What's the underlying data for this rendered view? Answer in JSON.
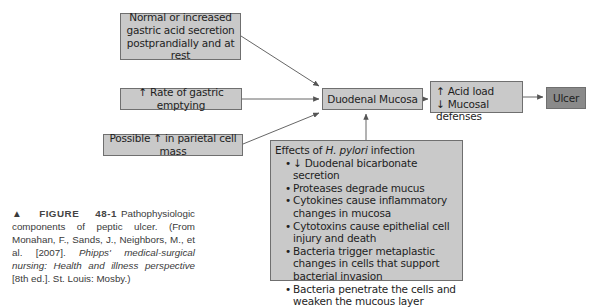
{
  "figure": {
    "nodes": {
      "normal_acid": {
        "lines": [
          "Normal or increased",
          "gastric acid secretion",
          "postprandially and at rest"
        ]
      },
      "gastric_emptying": {
        "text": "↑ Rate of gastric emptying"
      },
      "parietal_mass": {
        "text": "Possible ↑ in parietal cell mass"
      },
      "duodenal_mucosa": {
        "text": "Duodenal Mucosa"
      },
      "acid_load": {
        "lines": [
          "↑ Acid load",
          "↓ Mucosal defenses"
        ]
      },
      "ulcer": {
        "text": "Ulcer"
      },
      "h_pylori": {
        "title_prefix": "Effects of ",
        "title_italic": "H. pylori",
        "title_suffix": " infection",
        "items": [
          "↓ Duodenal bicarbonate secretion",
          "Proteases degrade mucus",
          "Cytokines cause inflammatory changes in mucosa",
          "Cytotoxins cause epithelial cell injury and death",
          "Bacteria trigger metaplastic changes in cells that support bacterial invasion",
          "Bacteria penetrate the cells and weaken the mucous layer"
        ]
      }
    },
    "colors": {
      "box_fill": "#c9c9c9",
      "ulcer_fill": "#8a8a8a",
      "border": "#6f6f6f",
      "arrow": "#555555"
    }
  },
  "caption": {
    "marker": "▲",
    "label": "FIGURE",
    "number": "48-1",
    "text1": " Pathophysiologic components of peptic ulcer. (From Monahan, F., Sands, J., Neighbors, M., et al. [2007]. ",
    "italic": "Phipps' medical-surgical nursing: Health and illness perspective",
    "text2": " [8th ed.]. St. Louis: Mosby.)"
  }
}
